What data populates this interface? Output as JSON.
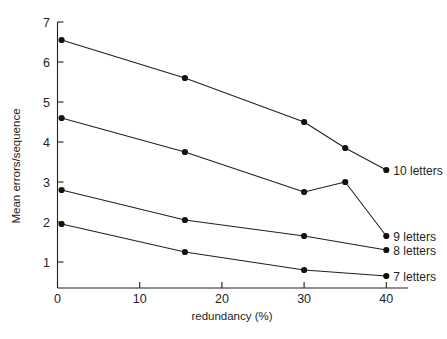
{
  "chart_data": {
    "type": "line",
    "title": "",
    "xlabel": "redundancy (%)",
    "ylabel": "Mean errors/sequence",
    "xlim": [
      0,
      45
    ],
    "ylim": [
      0,
      7
    ],
    "grid": false,
    "legend_position": "right-inline-labels",
    "xticks": [
      0,
      10,
      20,
      30,
      40
    ],
    "xtick_labels": [
      "0",
      "10",
      "20",
      "30",
      "40"
    ],
    "yticks": [
      1,
      2,
      3,
      4,
      5,
      6,
      7
    ],
    "ytick_labels": [
      "1",
      "2",
      "3",
      "4",
      "5",
      "6",
      "7"
    ],
    "series": [
      {
        "name": "10 letters",
        "label": "10 letters",
        "x": [
          0.5,
          15.5,
          30,
          35,
          40
        ],
        "values": [
          6.55,
          5.6,
          4.5,
          3.85,
          3.3
        ]
      },
      {
        "name": "9 letters",
        "label": "9 letters",
        "x": [
          0.5,
          15.5,
          30,
          35,
          40
        ],
        "values": [
          4.6,
          3.75,
          2.75,
          3.0,
          1.65
        ]
      },
      {
        "name": "8 letters",
        "label": "8 letters",
        "x": [
          0.5,
          15.5,
          30,
          40
        ],
        "values": [
          2.8,
          2.05,
          1.65,
          1.3
        ]
      },
      {
        "name": "7 letters",
        "label": "7 letters",
        "x": [
          0.5,
          15.5,
          30,
          40
        ],
        "values": [
          1.95,
          1.25,
          0.8,
          0.65
        ]
      }
    ],
    "colors": {
      "line": "#231f1e",
      "marker": "#141110",
      "axis": "#231f1e",
      "background": "#ffffff"
    }
  }
}
